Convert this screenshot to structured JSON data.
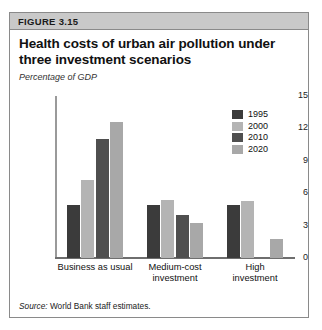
{
  "figure": {
    "header_label": "FIGURE 3.15",
    "title": "Health costs of urban air pollution under three investment scenarios",
    "axis_title": "Percentage of GDP",
    "source_prefix": "Source:",
    "source_text": "World Bank staff estimates."
  },
  "legend": {
    "items": [
      {
        "label": "1995",
        "color": "#3b3b3b"
      },
      {
        "label": "2000",
        "color": "#b4b4b4"
      },
      {
        "label": "2010",
        "color": "#4f4f4f"
      },
      {
        "label": "2020",
        "color": "#a8a8a8"
      }
    ]
  },
  "chart_data": {
    "type": "bar",
    "title": "Health costs of urban air pollution under three investment scenarios",
    "subtitle": "Percentage of GDP",
    "xlabel": "",
    "ylabel": "Percentage of GDP",
    "ylim": [
      0,
      15
    ],
    "yticks": [
      0,
      3,
      6,
      9,
      12,
      15
    ],
    "ytick_labels": [
      "0",
      "3",
      "6",
      "9",
      "12",
      "15"
    ],
    "grid": false,
    "legend_position": "top-right",
    "categories": [
      "Business as usual",
      "Medium-cost investment",
      "High investment"
    ],
    "category_lines": [
      [
        "Business as usual"
      ],
      [
        "Medium-cost",
        "investment"
      ],
      [
        "High",
        "investment"
      ]
    ],
    "series": [
      {
        "name": "1995",
        "color": "#3b3b3b",
        "values": [
          4.9,
          4.9,
          4.9
        ]
      },
      {
        "name": "2000",
        "color": "#b4b4b4",
        "values": [
          7.2,
          5.4,
          5.3
        ]
      },
      {
        "name": "2010",
        "color": "#4f4f4f",
        "values": [
          11.0,
          4.0,
          null
        ]
      },
      {
        "name": "2020",
        "color": "#a8a8a8",
        "values": [
          12.6,
          3.2,
          1.8
        ]
      }
    ],
    "source": "Source: World Bank staff estimates."
  }
}
